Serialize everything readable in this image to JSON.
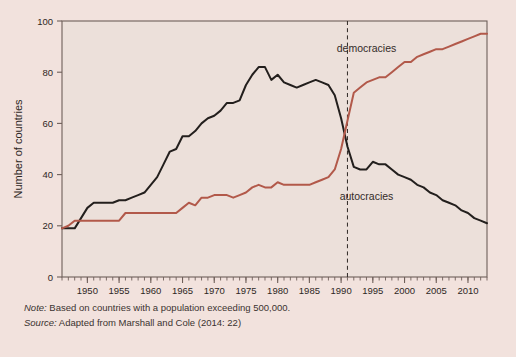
{
  "figure": {
    "background_color": "#f2e2dd",
    "plot_background_color": "#ece0da",
    "frame_color": "#6e5f59"
  },
  "notes": {
    "note_lead": "Note:",
    "note_text": " Based on countries with a population exceeding 500,000.",
    "source_lead": "Source:",
    "source_text": " Adapted from Marshall and Cole (2014: 22)"
  },
  "chart_data": {
    "type": "line",
    "title": "",
    "subtitle": "",
    "xlabel": "",
    "ylabel": "Number of countries",
    "xlim": [
      1946,
      2013
    ],
    "ylim": [
      0,
      100
    ],
    "yticks": [
      0,
      20,
      40,
      60,
      80,
      100
    ],
    "xticks": [
      1950,
      1955,
      1960,
      1965,
      1970,
      1975,
      1980,
      1985,
      1990,
      1995,
      2000,
      2005,
      2010
    ],
    "xtick_labels": [
      "1950",
      "1955",
      "1960",
      "1965",
      "1970",
      "1975",
      "1980",
      "1985",
      "1990",
      "1995",
      "2000",
      "2005",
      "2010"
    ],
    "ytick_labels": [
      "0",
      "20",
      "40",
      "60",
      "80",
      "100"
    ],
    "minor_xtick_interval": 1,
    "grid": false,
    "legend_position": "inline-annotations",
    "annotations": [
      {
        "text": "democracies",
        "x": 1994,
        "y": 88,
        "color": "#332b28"
      },
      {
        "text": "autocracies",
        "x": 1994,
        "y": 30,
        "color": "#332b28"
      }
    ],
    "reference_lines": [
      {
        "x": 1991,
        "style": "dashed",
        "color": "#2e2724",
        "label": ""
      }
    ],
    "x": [
      1946,
      1947,
      1948,
      1949,
      1950,
      1951,
      1952,
      1953,
      1954,
      1955,
      1956,
      1957,
      1958,
      1959,
      1960,
      1961,
      1962,
      1963,
      1964,
      1965,
      1966,
      1967,
      1968,
      1969,
      1970,
      1971,
      1972,
      1973,
      1974,
      1975,
      1976,
      1977,
      1978,
      1979,
      1980,
      1981,
      1982,
      1983,
      1984,
      1985,
      1986,
      1987,
      1988,
      1989,
      1990,
      1991,
      1992,
      1993,
      1994,
      1995,
      1996,
      1997,
      1998,
      1999,
      2000,
      2001,
      2002,
      2003,
      2004,
      2005,
      2006,
      2007,
      2008,
      2009,
      2010,
      2011,
      2012,
      2013
    ],
    "series": [
      {
        "name": "autocracies",
        "color": "#231f1d",
        "width": 2.0,
        "values": [
          19,
          19,
          19,
          23,
          27,
          29,
          29,
          29,
          29,
          30,
          30,
          31,
          32,
          33,
          36,
          39,
          44,
          49,
          50,
          55,
          55,
          57,
          60,
          62,
          63,
          65,
          68,
          68,
          69,
          75,
          79,
          82,
          82,
          77,
          79,
          76,
          75,
          74,
          75,
          76,
          77,
          76,
          75,
          71,
          62,
          51,
          43,
          42,
          42,
          45,
          44,
          44,
          42,
          40,
          39,
          38,
          36,
          35,
          33,
          32,
          30,
          29,
          28,
          26,
          25,
          23,
          22,
          21
        ]
      },
      {
        "name": "democracies",
        "color": "#b2594a",
        "width": 2.0,
        "values": [
          19,
          20,
          22,
          22,
          22,
          22,
          22,
          22,
          22,
          22,
          25,
          25,
          25,
          25,
          25,
          25,
          25,
          25,
          25,
          27,
          29,
          28,
          31,
          31,
          32,
          32,
          32,
          31,
          32,
          33,
          35,
          36,
          35,
          35,
          37,
          36,
          36,
          36,
          36,
          36,
          37,
          38,
          39,
          42,
          50,
          61,
          72,
          74,
          76,
          77,
          78,
          78,
          80,
          82,
          84,
          84,
          86,
          87,
          88,
          89,
          89,
          90,
          91,
          92,
          93,
          94,
          95,
          95
        ]
      }
    ]
  }
}
